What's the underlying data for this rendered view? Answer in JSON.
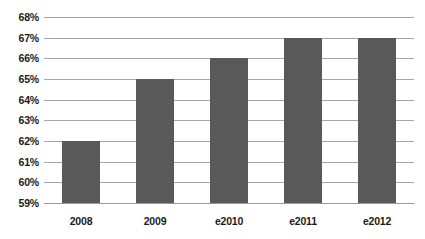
{
  "chart_data": {
    "type": "bar",
    "title": "",
    "subtitle": "",
    "xlabel": "",
    "ylabel": "",
    "categories": [
      "2008",
      "2009",
      "e2010",
      "e2011",
      "e2012"
    ],
    "values": [
      62,
      65,
      66,
      67,
      67
    ],
    "value_labels": [
      "62%",
      "65%",
      "66%",
      "67%",
      "67%"
    ],
    "ylim": [
      59,
      68
    ],
    "ytick_step": 1,
    "ytick_labels": [
      "68%",
      "67%",
      "66%",
      "65%",
      "64%",
      "63%",
      "62%",
      "61%",
      "60%",
      "59%"
    ],
    "ytick_values": [
      68,
      67,
      66,
      65,
      64,
      63,
      62,
      61,
      60,
      59
    ],
    "grid": true,
    "grid_axis": "y",
    "legend": false,
    "legend_position": "none",
    "series": [
      {
        "name": "",
        "values": [
          62,
          65,
          66,
          67,
          67
        ]
      }
    ]
  },
  "style": {
    "bar_color": "#595959",
    "gridline_color": "#a6a6a6",
    "baseline_color": "#9a9a9a",
    "background_color": "#ffffff",
    "label_color": "#1b1b1b"
  }
}
